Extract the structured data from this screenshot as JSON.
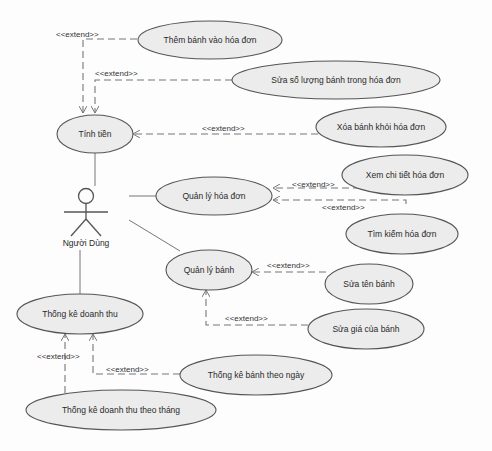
{
  "diagram": {
    "type": "uml-use-case",
    "colors": {
      "background": "#fdfdfd",
      "ellipse_fill": "#ececec",
      "stroke": "#555555",
      "text": "#2a2a2a"
    },
    "actor": {
      "id": "nguoi-dung",
      "label": "Người Dùng"
    },
    "use_cases": [
      {
        "id": "them-banh",
        "label": "Thêm bánh vào hóa đơn"
      },
      {
        "id": "sua-so-luong",
        "label": "Sửa số lượng bánh trong hóa đơn"
      },
      {
        "id": "tinh-tien",
        "label": "Tính tiền"
      },
      {
        "id": "xoa-banh",
        "label": "Xóa bánh khỏi hóa đơn"
      },
      {
        "id": "xem-chi-tiet",
        "label": "Xem chi tiết hóa đơn"
      },
      {
        "id": "quan-ly-hoa-don",
        "label": "Quản lý hóa đơn"
      },
      {
        "id": "tim-kiem",
        "label": "Tìm kiếm hóa đơn"
      },
      {
        "id": "quan-ly-banh",
        "label": "Quản lý bánh"
      },
      {
        "id": "sua-ten-banh",
        "label": "Sửa tên bánh"
      },
      {
        "id": "sua-gia",
        "label": "Sửa giá của bánh"
      },
      {
        "id": "thong-ke-doanh-thu",
        "label": "Thống kê doanh thu"
      },
      {
        "id": "thong-ke-banh-ngay",
        "label": "Thống kê bánh theo ngày"
      },
      {
        "id": "thong-ke-thang",
        "label": "Thống kê doanh thu theo tháng"
      }
    ],
    "associations": [
      {
        "from": "nguoi-dung",
        "to": "tinh-tien"
      },
      {
        "from": "nguoi-dung",
        "to": "quan-ly-hoa-don"
      },
      {
        "from": "nguoi-dung",
        "to": "quan-ly-banh"
      },
      {
        "from": "nguoi-dung",
        "to": "thong-ke-doanh-thu"
      }
    ],
    "stereotype_label": "<<extend>>",
    "extends": [
      {
        "from": "them-banh",
        "to": "tinh-tien",
        "label": "<<extend>>"
      },
      {
        "from": "sua-so-luong",
        "to": "tinh-tien",
        "label": "<<extend>>"
      },
      {
        "from": "xoa-banh",
        "to": "tinh-tien",
        "label": "<<extend>>"
      },
      {
        "from": "xem-chi-tiet",
        "to": "quan-ly-hoa-don",
        "label": "<<extend>>"
      },
      {
        "from": "tim-kiem",
        "to": "quan-ly-hoa-don",
        "label": "<<extend>>"
      },
      {
        "from": "sua-ten-banh",
        "to": "quan-ly-banh",
        "label": "<<extend>>"
      },
      {
        "from": "sua-gia",
        "to": "quan-ly-banh",
        "label": "<<extend>>"
      },
      {
        "from": "thong-ke-thang",
        "to": "thong-ke-doanh-thu",
        "label": "<<extend>>"
      },
      {
        "from": "thong-ke-banh-ngay",
        "to": "thong-ke-doanh-thu",
        "label": "<<extend>>"
      }
    ]
  }
}
